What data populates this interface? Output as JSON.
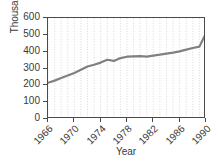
{
  "chart_data": {
    "type": "line",
    "title": "",
    "xlabel": "Year",
    "ylabel": "Thousands",
    "xlim": [
      1966,
      1990
    ],
    "ylim": [
      0,
      600
    ],
    "grid": "vertical-dotted",
    "legend": "none",
    "line_color": "#808080",
    "axis_color": "#4a4a4a",
    "grid_color": "#c8c8c8",
    "background": "#ffffff",
    "x_tick_labels": [
      "1966",
      "1970",
      "1974",
      "1978",
      "1982",
      "1986",
      "1990"
    ],
    "x_tick_values": [
      1966,
      1970,
      1974,
      1978,
      1982,
      1986,
      1990
    ],
    "y_tick_labels": [
      "600",
      "500",
      "400",
      "300",
      "200",
      "100",
      "0"
    ],
    "y_tick_values": [
      600,
      500,
      400,
      300,
      200,
      100,
      0
    ],
    "x": [
      1966,
      1967,
      1968,
      1969,
      1970,
      1971,
      1972,
      1973,
      1974,
      1975,
      1976,
      1977,
      1978,
      1979,
      1980,
      1981,
      1982,
      1983,
      1984,
      1985,
      1986,
      1987,
      1988,
      1989,
      1990
    ],
    "values": [
      215,
      228,
      243,
      258,
      273,
      292,
      312,
      322,
      335,
      352,
      345,
      362,
      370,
      372,
      373,
      371,
      377,
      382,
      388,
      394,
      402,
      412,
      422,
      430,
      510
    ],
    "series": [
      {
        "name": "Thousands",
        "values": [
          215,
          228,
          243,
          258,
          273,
          292,
          312,
          322,
          335,
          352,
          345,
          362,
          370,
          372,
          373,
          371,
          377,
          382,
          388,
          394,
          402,
          412,
          422,
          430,
          510
        ]
      }
    ]
  },
  "axes": {
    "y_title": "Thousands",
    "x_title": "Year",
    "y_labels": [
      {
        "text": "600"
      },
      {
        "text": "500"
      },
      {
        "text": "400"
      },
      {
        "text": "300"
      },
      {
        "text": "200"
      },
      {
        "text": "100"
      },
      {
        "text": "0"
      }
    ],
    "x_labels": [
      {
        "text": "1966"
      },
      {
        "text": "1970"
      },
      {
        "text": "1974"
      },
      {
        "text": "1978"
      },
      {
        "text": "1982"
      },
      {
        "text": "1986"
      },
      {
        "text": "1990"
      }
    ]
  }
}
